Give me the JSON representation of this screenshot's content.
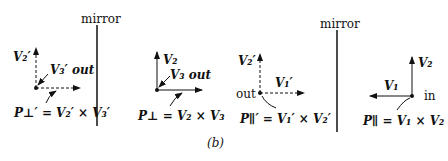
{
  "figure_label": "(b)",
  "mirror_label": "mirror",
  "panels": [
    {
      "id": "mirror-perp",
      "vec_up": "V₂′",
      "vec_out": "V₃′ out",
      "equation": "P⊥′ = V₂′ × V₃′",
      "style": "dashed"
    },
    {
      "id": "real-perp",
      "vec_up": "V₂",
      "vec_out": "V₃ out",
      "equation": "P⊥ = V₂ × V₃",
      "style": "solid"
    },
    {
      "id": "mirror-par",
      "vec_up": "V₂′",
      "vec_side": "V₁′",
      "dir_label": "out",
      "equation": "P∥′ = V₁′ × V₂′",
      "style": "dashed"
    },
    {
      "id": "real-par",
      "vec_up": "V₂",
      "vec_side": "V₁",
      "dir_label": "in",
      "equation": "P∥ = V₁ × V₂",
      "style": "solid"
    }
  ]
}
